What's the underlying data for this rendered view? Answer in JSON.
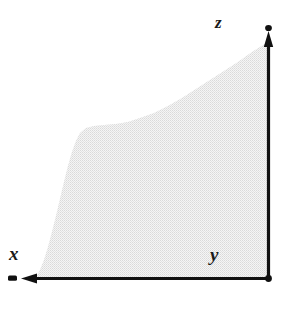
{
  "figure": {
    "background_color": "#ffffff",
    "width": 290,
    "height": 310,
    "axis_color": "#111111",
    "region_fill_color": "#e8e8e8",
    "region_fill_style": "halftone-dither",
    "labels": {
      "z": "z",
      "y": "y",
      "x": "x"
    },
    "axes": [
      {
        "name": "vertical-axis",
        "label": "z",
        "orientation": "vertical",
        "arrow_direction": "up",
        "x": 268,
        "y_start": 278,
        "y_end": 35
      },
      {
        "name": "horizontal-axis",
        "label": "x",
        "orientation": "horizontal",
        "arrow_direction": "left",
        "y": 278,
        "x_start": 268,
        "x_end": 25
      },
      {
        "name": "origin-corner",
        "label": "y",
        "x": 268,
        "y": 278
      }
    ]
  },
  "chart_data": {
    "type": "area",
    "title": "",
    "xlabel": "x",
    "ylabel": "z",
    "corner_label": "y",
    "grid": false,
    "legend": false,
    "axis_arrows": {
      "x": "left",
      "z": "up"
    },
    "note": "Monotone decreasing boundary curve enclosing a shaded region against the right (vertical) and bottom (horizontal) axes; x increases to the left, z increases upward.",
    "boundary_curve_points_px": [
      [
        268,
        42
      ],
      [
        252,
        52
      ],
      [
        238,
        62
      ],
      [
        224,
        71
      ],
      [
        210,
        80
      ],
      [
        196,
        89
      ],
      [
        182,
        98
      ],
      [
        168,
        106
      ],
      [
        154,
        113
      ],
      [
        140,
        118
      ],
      [
        128,
        122
      ],
      [
        116,
        124
      ],
      [
        104,
        125
      ],
      [
        94,
        126
      ],
      [
        86,
        128
      ],
      [
        80,
        133
      ],
      [
        76,
        141
      ],
      [
        72,
        152
      ],
      [
        68,
        166
      ],
      [
        64,
        182
      ],
      [
        60,
        199
      ],
      [
        56,
        216
      ],
      [
        52,
        232
      ],
      [
        48,
        247
      ],
      [
        44,
        260
      ],
      [
        40,
        270
      ],
      [
        36,
        278
      ]
    ],
    "axis_extent_px": {
      "x_axis_y": 278,
      "z_axis_x": 268,
      "x_axis_min": 25,
      "x_axis_max": 268,
      "z_axis_min": 35,
      "z_axis_max": 278
    }
  }
}
